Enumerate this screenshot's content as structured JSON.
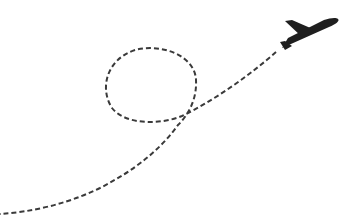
{
  "illustration": {
    "subject": "airplane with dashed flight path loop",
    "icons": {
      "plane": "airplane-icon"
    },
    "colors": {
      "background": "#ffffff",
      "plane": "#1f1f1f",
      "path": "#3a3a3a"
    },
    "path": {
      "style": "dashed",
      "dash": "5 3",
      "stroke_width": 2
    }
  }
}
